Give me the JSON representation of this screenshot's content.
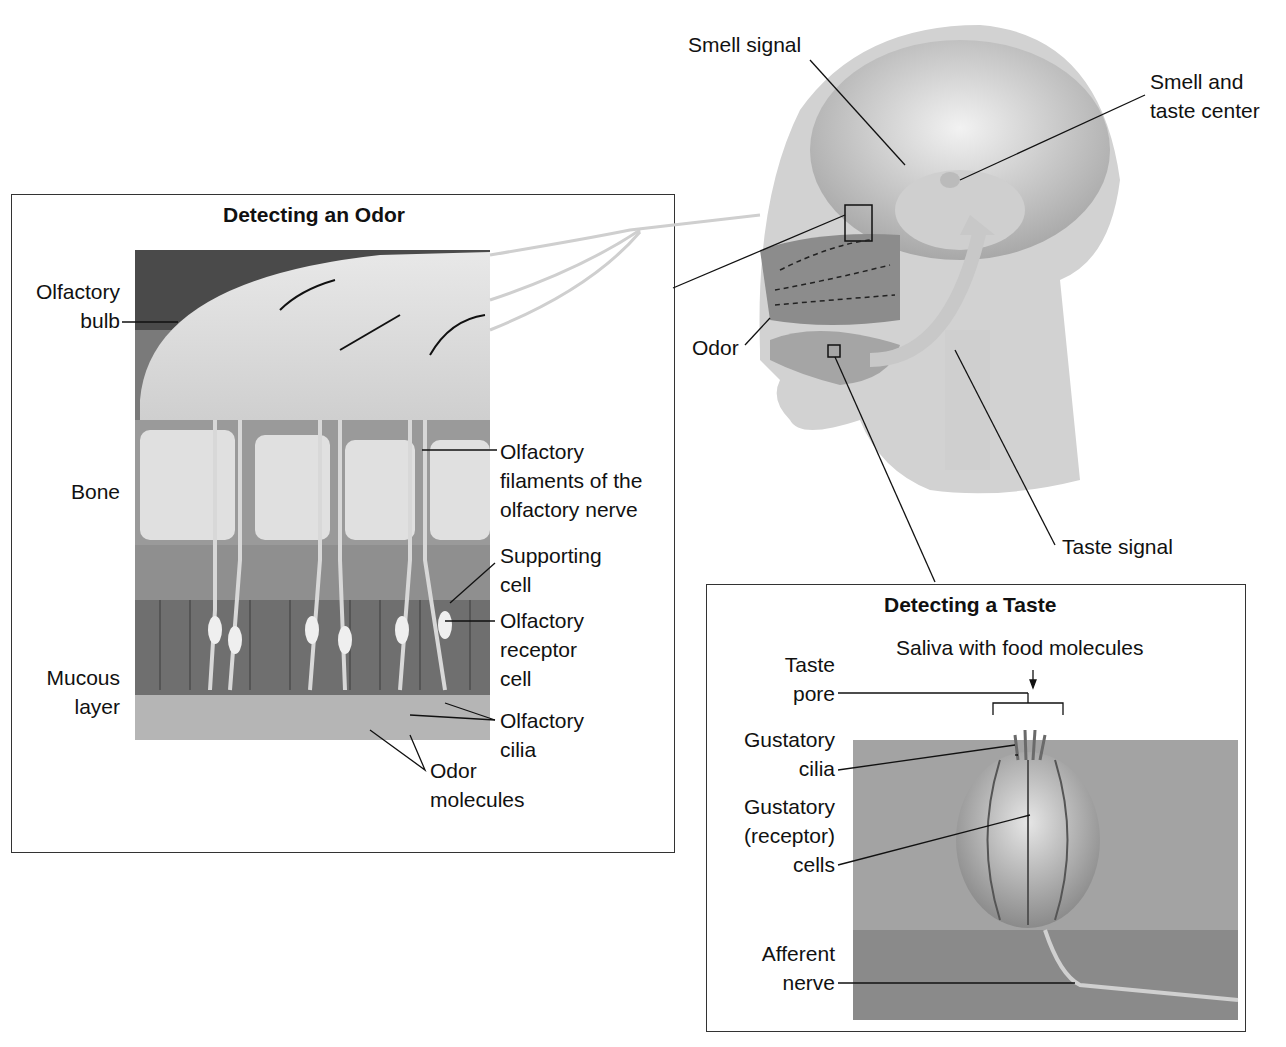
{
  "odor_panel": {
    "title": "Detecting an Odor",
    "labels": {
      "olfactory_bulb": [
        "Olfactory",
        "bulb"
      ],
      "bone": "Bone",
      "mucous_layer": [
        "Mucous",
        "layer"
      ],
      "olfactory_filaments": [
        "Olfactory",
        "filaments of the",
        "olfactory nerve"
      ],
      "supporting_cell": [
        "Supporting",
        "cell"
      ],
      "olfactory_receptor_cell": [
        "Olfactory",
        "receptor",
        "cell"
      ],
      "olfactory_cilia": [
        "Olfactory",
        "cilia"
      ],
      "odor_molecules": [
        "Odor",
        "molecules"
      ]
    }
  },
  "head": {
    "labels": {
      "smell_signal": "Smell signal",
      "smell_taste_center": [
        "Smell and",
        "taste center"
      ],
      "odor": "Odor",
      "taste_signal": "Taste signal"
    }
  },
  "taste_panel": {
    "title": "Detecting a Taste",
    "labels": {
      "saliva": "Saliva with food molecules",
      "taste_pore": [
        "Taste",
        "pore"
      ],
      "gustatory_cilia": [
        "Gustatory",
        "cilia"
      ],
      "gustatory_cells": [
        "Gustatory",
        "(receptor)",
        "cells"
      ],
      "afferent_nerve": [
        "Afferent",
        "nerve"
      ]
    }
  }
}
